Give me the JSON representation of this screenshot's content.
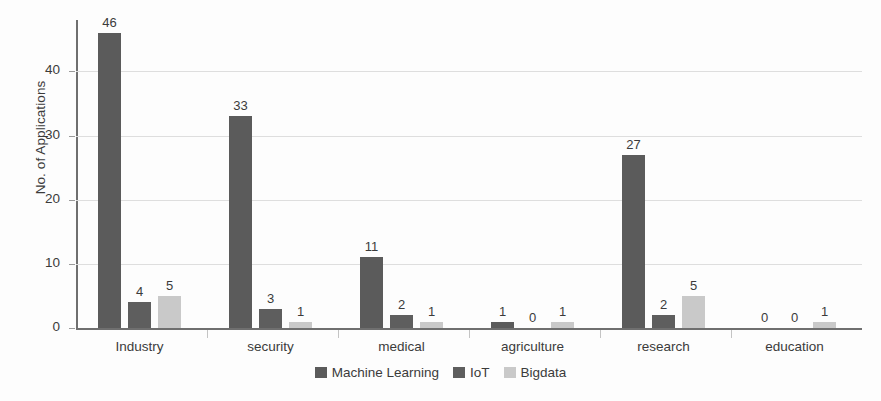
{
  "chart_data": {
    "type": "bar",
    "title": "",
    "subtitle": "",
    "xlabel": "",
    "ylabel": "No. of Applications",
    "ylim": [
      0,
      48
    ],
    "yticks": [
      0,
      10,
      20,
      30,
      40
    ],
    "ytick_labels": [
      "0",
      "10",
      "20",
      "30",
      "40"
    ],
    "grid": "horizontal",
    "legend_position": "bottom-center",
    "categories": [
      "Industry",
      "security",
      "medical",
      "agriculture",
      "research",
      "education"
    ],
    "series": [
      {
        "name": "Machine Learning",
        "color": "#5b5b5b",
        "values": [
          46,
          33,
          11,
          1,
          27,
          0
        ],
        "labels": [
          "46",
          "33",
          "11",
          "1",
          "27",
          "0"
        ]
      },
      {
        "name": "IoT",
        "color": "#5e5e5e",
        "values": [
          4,
          3,
          2,
          0,
          2,
          0
        ],
        "labels": [
          "4",
          "3",
          "2",
          "0",
          "2",
          "0"
        ]
      },
      {
        "name": "Bigdata",
        "color": "#c9c9c9",
        "values": [
          5,
          1,
          1,
          1,
          5,
          1
        ],
        "labels": [
          "5",
          "1",
          "1",
          "1",
          "5",
          "1"
        ]
      }
    ]
  },
  "colors": {
    "background": "#fdfdfd",
    "axis": "#6f6f6f",
    "gridline": "#dedede",
    "text": "#3b3b3b",
    "machine_learning": "#5b5b5b",
    "iot": "#5e5e5e",
    "bigdata": "#c9c9c9"
  }
}
